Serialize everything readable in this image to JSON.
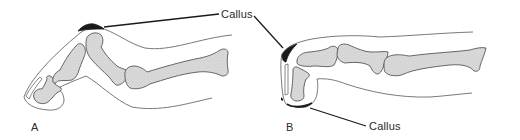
{
  "figure": {
    "colors": {
      "background": "#ffffff",
      "outline": "#555555",
      "bone_fill": "#d6d6d6",
      "bone_stroke": "#444444",
      "callus": "#1a1a1a",
      "leader_line": "#1a1a1a",
      "text": "#2a2a2a"
    },
    "panels": [
      {
        "id": "A",
        "letter": "A",
        "callus_label": "Callus",
        "callus_location": "top of bent joint"
      },
      {
        "id": "B",
        "letter": "B",
        "callus_label": "Callus",
        "callus_location": "toe tip and top of joint"
      }
    ]
  }
}
